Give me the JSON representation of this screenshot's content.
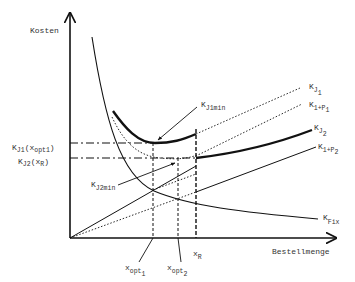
{
  "axes": {
    "y_label": "Kosten",
    "x_label": "Bestellmenge"
  },
  "curves": {
    "kj1": {
      "base": "K",
      "sub": "J",
      "subsub": "1"
    },
    "k1p1": {
      "base": "K",
      "sub": "1+P",
      "subsub": "1"
    },
    "kj2": {
      "base": "K",
      "sub": "J",
      "subsub": "2"
    },
    "k1p2": {
      "base": "K",
      "sub": "1+P",
      "subsub": "2"
    },
    "kfix": {
      "base": "K",
      "sub": "Fix"
    }
  },
  "annotations": {
    "kj1min": {
      "base": "K",
      "sub": "J1min"
    },
    "kj2min": {
      "base": "K",
      "sub": "J2min"
    },
    "y_mark_1": {
      "base": "K",
      "sub": "J1",
      "paren_open": "(x",
      "paren_sub": "opt1",
      "paren_close": ")"
    },
    "y_mark_2": {
      "base": "K",
      "sub": "J2",
      "paren_open": "(x",
      "paren_sub": "R",
      "paren_close": ")"
    }
  },
  "x_marks": {
    "xopt1": {
      "base": "x",
      "sub": "opt",
      "subsub": "1"
    },
    "xopt2": {
      "base": "x",
      "sub": "opt",
      "subsub": "2"
    },
    "xr": {
      "base": "x",
      "sub": "R"
    }
  },
  "colors": {
    "ink": "#111111",
    "text": "#333333",
    "background": "#ffffff"
  }
}
